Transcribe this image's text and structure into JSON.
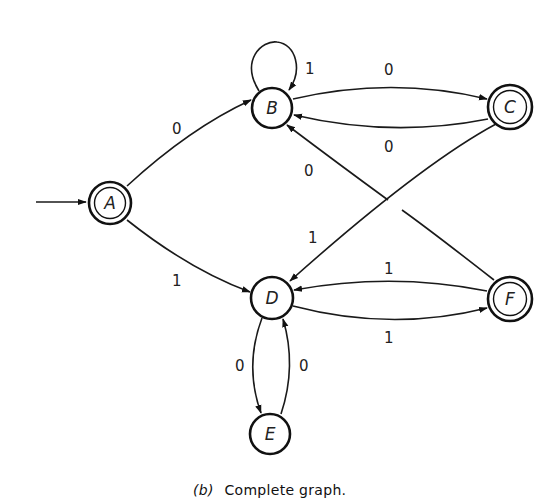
{
  "figure": {
    "caption_tag": "(b)",
    "caption_text": "Complete graph."
  },
  "nodes": [
    {
      "id": "A",
      "label": "A",
      "accepting": true,
      "initial": true
    },
    {
      "id": "B",
      "label": "B",
      "accepting": false,
      "initial": false
    },
    {
      "id": "C",
      "label": "C",
      "accepting": true,
      "initial": false
    },
    {
      "id": "D",
      "label": "D",
      "accepting": false,
      "initial": false
    },
    {
      "id": "E",
      "label": "E",
      "accepting": false,
      "initial": false
    },
    {
      "id": "F",
      "label": "F",
      "accepting": true,
      "initial": false
    }
  ],
  "edges": [
    {
      "from": "A",
      "to": "B",
      "label": "0"
    },
    {
      "from": "A",
      "to": "D",
      "label": "1"
    },
    {
      "from": "B",
      "to": "B",
      "label": "1"
    },
    {
      "from": "B",
      "to": "C",
      "label": "0"
    },
    {
      "from": "C",
      "to": "B",
      "label": "0"
    },
    {
      "from": "C",
      "to": "D",
      "label": "1"
    },
    {
      "from": "F",
      "to": "B",
      "label": "0"
    },
    {
      "from": "F",
      "to": "D",
      "label": "1"
    },
    {
      "from": "D",
      "to": "F",
      "label": "1"
    },
    {
      "from": "D",
      "to": "E",
      "label": "0"
    },
    {
      "from": "E",
      "to": "D",
      "label": "0"
    }
  ]
}
